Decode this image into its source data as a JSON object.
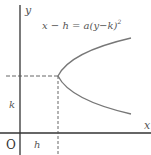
{
  "diagram": {
    "type": "parabola-graph",
    "equation": "x − h = a(y−k)",
    "equation_exponent": "2",
    "axes": {
      "x_label": "x",
      "y_label": "y",
      "origin_label": "O"
    },
    "vertex_labels": {
      "h": "h",
      "k": "k"
    },
    "colors": {
      "axis": "#333333",
      "curve": "#777777",
      "dashed": "#555555",
      "text": "#555555"
    }
  }
}
